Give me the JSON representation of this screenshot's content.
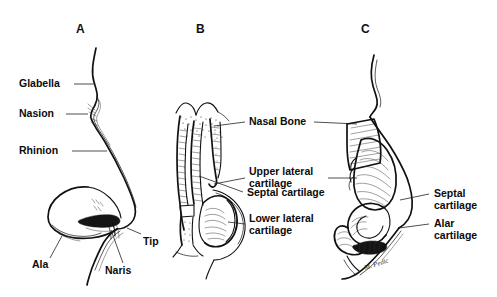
{
  "figure": {
    "background_color": "#ffffff",
    "ink_color": "#111111",
    "panel_count": 3
  },
  "panels": [
    {
      "id": "A",
      "letter": "A",
      "caption": "External nasal surface landmarks (lateral view)",
      "labels": [
        {
          "key": "glabella",
          "text": "Glabella"
        },
        {
          "key": "nasion",
          "text": "Nasion"
        },
        {
          "key": "rhinion",
          "text": "Rhinion"
        },
        {
          "key": "tip",
          "text": "Tip"
        },
        {
          "key": "ala",
          "text": "Ala"
        },
        {
          "key": "naris",
          "text": "Naris"
        }
      ]
    },
    {
      "id": "B",
      "letter": "B",
      "caption": "Nasal skeleton, frontal/basal view",
      "labels": [
        {
          "key": "nasal_bone",
          "text": "Nasal Bone"
        },
        {
          "key": "upper_lateral_cartilage",
          "text": "Upper lateral\ncartilage"
        },
        {
          "key": "septal_cartilage",
          "text": "Septal cartilage"
        },
        {
          "key": "lower_lateral_cartilage",
          "text": "Lower lateral\ncartilage"
        }
      ]
    },
    {
      "id": "C",
      "letter": "C",
      "caption": "Nasal skeleton, lateral view",
      "labels": [
        {
          "key": "septal_cartilage",
          "text": "Septal\ncartilage"
        },
        {
          "key": "alar_cartilage",
          "text": "Alar\ncartilage"
        }
      ],
      "signature": "M. Pedic"
    }
  ]
}
